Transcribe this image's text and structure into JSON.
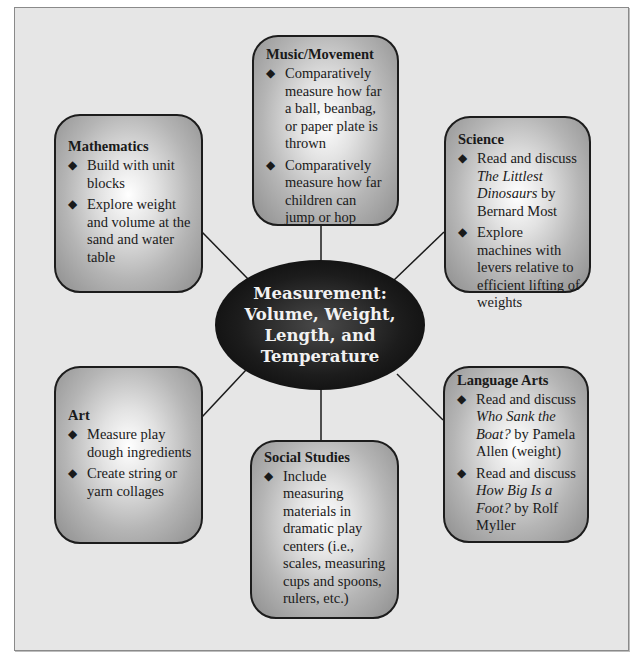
{
  "center": {
    "lines": [
      "Measurement:",
      "Volume, Weight,",
      "Length, and",
      "Temperature"
    ]
  },
  "boxes": {
    "music": {
      "title": "Music/Movement",
      "items": [
        [
          "Comparatively measure how far a ball, beanbag, or paper plate is thrown"
        ],
        [
          "Comparatively measure how far children can jump or hop"
        ]
      ]
    },
    "math": {
      "title": "Mathematics",
      "items": [
        [
          "Build with unit blocks"
        ],
        [
          "Explore weight and volume at the sand and water table"
        ]
      ]
    },
    "science": {
      "title": "Science",
      "items": [
        {
          "before": "Read and discuss ",
          "italic": "The Littlest Dinosaurs",
          "after": " by Bernard Most"
        },
        [
          "Explore machines with levers relative to efficient lifting of weights"
        ]
      ]
    },
    "art": {
      "title": "Art",
      "items": [
        [
          "Measure play dough ingredients"
        ],
        [
          "Create string or yarn collages"
        ]
      ]
    },
    "social": {
      "title": "Social Studies",
      "items": [
        [
          "Include measuring materials in dramatic play centers (i.e., scales, measuring cups and spoons, rulers, etc.)"
        ]
      ]
    },
    "lang": {
      "title": "Language Arts",
      "items": [
        {
          "before": "Read and discuss ",
          "italic": "Who Sank the Boat?",
          "after": " by Pamela Allen (weight)"
        },
        {
          "before": "Read and discuss ",
          "italic": "How Big Is a Foot?",
          "after": " by Rolf Myller"
        }
      ]
    }
  },
  "bullet_glyph": "◆",
  "colors": {
    "frame_bg": "#e6e6e6",
    "center_fill": "#111111",
    "center_text": "#f2f2f2",
    "connector": "#1a1a1a"
  }
}
